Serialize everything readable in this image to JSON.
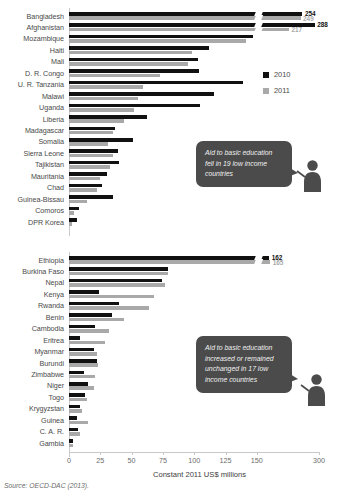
{
  "source_note": "Source: OECD-DAC (2013).",
  "axis": {
    "title": "Constant 2011 US$ millions",
    "ticks": [
      0,
      25,
      50,
      75,
      100,
      125,
      150,
      300
    ],
    "tick_labels": [
      "0",
      "25",
      "50",
      "75",
      "100",
      "125",
      "150",
      "300"
    ],
    "has_break": true,
    "break_after": 150
  },
  "legend": {
    "position": "right",
    "items": [
      {
        "label": "2010",
        "color": "#111111"
      },
      {
        "label": "2011",
        "color": "#a9a9a9"
      }
    ]
  },
  "callouts": [
    {
      "id": "callout-decline",
      "text": "Aid to basic education fell in 19 low income countries"
    },
    {
      "id": "callout-increase",
      "text": "Aid to basic education increased or remained unchanged in 17 low income countries"
    }
  ],
  "chart_data": [
    {
      "type": "bar",
      "orientation": "horizontal",
      "title": "Aid to basic education fell in 19 low income countries",
      "xlabel": "Constant 2011 US$ millions",
      "ylabel": "",
      "xlim": [
        0,
        160
      ],
      "grid": false,
      "legend_position": "right",
      "categories": [
        "Bangladesh",
        "Afghanistan",
        "Mozambique",
        "Haiti",
        "Mali",
        "D. R. Congo",
        "U. R. Tanzania",
        "Malawi",
        "Uganda",
        "Liberia",
        "Madagascar",
        "Somalia",
        "Sierra Leone",
        "Tajikistan",
        "Mauritania",
        "Chad",
        "Guinea-Bissau",
        "Comoros",
        "DPR Korea"
      ],
      "series": [
        {
          "name": "2010",
          "color": "#111111",
          "values": [
            254,
            288,
            147,
            112,
            103,
            104,
            139,
            116,
            105,
            62,
            37,
            51,
            39,
            40,
            30,
            26,
            35,
            8,
            6
          ]
        },
        {
          "name": "2011",
          "color": "#a9a9a9",
          "values": [
            249,
            217,
            141,
            98,
            95,
            73,
            59,
            55,
            52,
            44,
            35,
            31,
            35,
            33,
            25,
            22,
            14,
            4,
            2
          ]
        }
      ],
      "data_labels": [
        {
          "category": "Bangladesh",
          "series": "2010",
          "value": 254,
          "text": "254"
        },
        {
          "category": "Bangladesh",
          "series": "2011",
          "value": 249,
          "text": "249"
        },
        {
          "category": "Afghanistan",
          "series": "2010",
          "value": 288,
          "text": "288"
        },
        {
          "category": "Afghanistan",
          "series": "2011",
          "value": 217,
          "text": "217"
        }
      ]
    },
    {
      "type": "bar",
      "orientation": "horizontal",
      "title": "Aid to basic education increased or remained unchanged in 17 low income countries",
      "xlabel": "Constant 2011 US$ millions",
      "ylabel": "",
      "xlim": [
        0,
        160
      ],
      "grid": false,
      "legend_position": "right",
      "categories": [
        "Ethiopia",
        "Burkina Faso",
        "Nepal",
        "Kenya",
        "Rwanda",
        "Benin",
        "Cambodia",
        "Eritrea",
        "Myanmar",
        "Burundi",
        "Zimbabwe",
        "Niger",
        "Togo",
        "Krygyzstan",
        "Guinea",
        "C. A. R.",
        "Gambia"
      ],
      "series": [
        {
          "name": "2010",
          "color": "#111111",
          "values": [
            162,
            79,
            74,
            24,
            40,
            34,
            21,
            9,
            20,
            22,
            12,
            15,
            13,
            9,
            6,
            7,
            3
          ]
        },
        {
          "name": "2011",
          "color": "#a9a9a9",
          "values": [
            165,
            79,
            77,
            68,
            64,
            44,
            32,
            29,
            22,
            23,
            21,
            20,
            14,
            10,
            15,
            9,
            3
          ]
        }
      ],
      "data_labels": [
        {
          "category": "Ethiopia",
          "series": "2010",
          "value": 162,
          "text": "162"
        },
        {
          "category": "Ethiopia",
          "series": "2011",
          "value": 165,
          "text": "165"
        }
      ]
    }
  ]
}
